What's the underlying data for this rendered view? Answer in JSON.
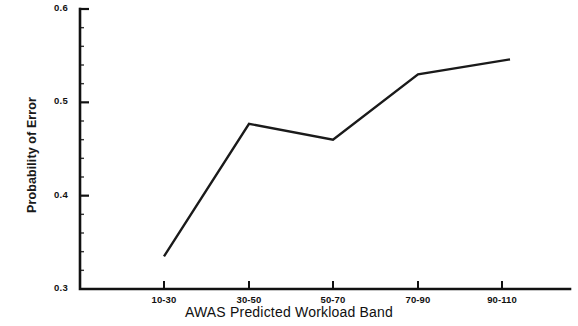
{
  "chart_data": {
    "type": "line",
    "title": "",
    "subtitle": "",
    "xlabel": "AWAS Predicted Workload Band",
    "ylabel": "Probability of Error",
    "categories": [
      "10-30",
      "30-50",
      "50-70",
      "70-90",
      "90-110"
    ],
    "values": [
      0.335,
      0.477,
      0.46,
      0.53,
      0.546
    ],
    "series": [
      {
        "name": "Probability of Error",
        "values": [
          0.335,
          0.477,
          0.46,
          0.53,
          0.546
        ]
      }
    ],
    "ylim": [
      0.3,
      0.6
    ],
    "ytick_labels": [
      "0.3",
      "0.4",
      "0.5",
      "0.6"
    ],
    "ytick_values": [
      0.3,
      0.4,
      0.5,
      0.6
    ],
    "yminor_step": 0.02,
    "grid": false,
    "legend": false,
    "legend_position": "none",
    "line_color": "#1a1a1a",
    "axis_color": "#111111",
    "background_color": "#ffffff",
    "markers": false
  }
}
